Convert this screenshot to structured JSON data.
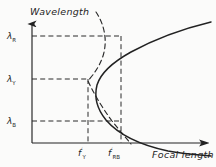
{
  "figure": {
    "kind": "hand-drawn-plot",
    "background_color": "#fbfbfa",
    "ink_color": "#222222",
    "axes": {
      "y_title": "Wavelength",
      "x_title": "Focal length",
      "origin_px": [
        32,
        143
      ],
      "y_top_px": 22,
      "x_right_px": 210
    },
    "y_ticks": [
      {
        "name": "lambda-R",
        "label_base": "λ",
        "label_sub": "R",
        "y_px": 36
      },
      {
        "name": "lambda-Y",
        "label_base": "λ",
        "label_sub": "Y",
        "y_px": 79
      },
      {
        "name": "lambda-B",
        "label_base": "λ",
        "label_sub": "B",
        "y_px": 121
      }
    ],
    "x_ticks": [
      {
        "name": "f-prime-Y",
        "label_base": "f",
        "label_prime": "′",
        "label_sub": "Y",
        "x_px": 82
      },
      {
        "name": "f-prime-RB",
        "label_base": "f",
        "label_prime": "′",
        "label_sub": "RB",
        "x_px": 120
      }
    ],
    "gridlines": [
      {
        "name": "gridline-lambda-R",
        "orientation": "horizontal",
        "from_px": [
          32,
          36
        ],
        "to_px": [
          121,
          36
        ]
      },
      {
        "name": "gridline-lambda-Y",
        "orientation": "horizontal",
        "from_px": [
          32,
          79
        ],
        "to_px": [
          90,
          79
        ]
      },
      {
        "name": "gridline-lambda-B",
        "orientation": "horizontal",
        "from_px": [
          32,
          121
        ],
        "to_px": [
          121,
          121
        ]
      },
      {
        "name": "gridline-f-prime-Y",
        "orientation": "vertical",
        "from_px": [
          88,
          79
        ],
        "to_px": [
          88,
          143
        ]
      },
      {
        "name": "gridline-f-prime-RB",
        "orientation": "vertical",
        "from_px": [
          121,
          36
        ],
        "to_px": [
          121,
          143
        ]
      }
    ],
    "curves": [
      {
        "name": "solid-dispersion-curve",
        "style": "solid",
        "description": "wide right-opening parabola, vertex at f'_Y / lambda_Y",
        "vertex_px": [
          88,
          79
        ],
        "points_px": [
          [
            210,
            22
          ],
          [
            196,
            26
          ],
          [
            178,
            31
          ],
          [
            160,
            37
          ],
          [
            143,
            44
          ],
          [
            130,
            52
          ],
          [
            120,
            61
          ],
          [
            110,
            72
          ],
          [
            103,
            85
          ],
          [
            100,
            95
          ],
          [
            100,
            106
          ],
          [
            104,
            118
          ],
          [
            112,
            130
          ],
          [
            124,
            140
          ],
          [
            134,
            145
          ],
          [
            150,
            149
          ],
          [
            170,
            152
          ],
          [
            190,
            154
          ],
          [
            210,
            155
          ]
        ]
      },
      {
        "name": "dashed-reference-curve",
        "style": "dashed",
        "description": "narrow right-opening parabola crossing the solid curve",
        "vertex_px": [
          86,
          80
        ],
        "points_px": [
          [
            96,
            12
          ],
          [
            102,
            20
          ],
          [
            106,
            30
          ],
          [
            106,
            42
          ],
          [
            102,
            54
          ],
          [
            96,
            66
          ],
          [
            90,
            76
          ],
          [
            88,
            82
          ],
          [
            90,
            92
          ],
          [
            96,
            104
          ],
          [
            105,
            116
          ],
          [
            115,
            127
          ],
          [
            124,
            136
          ],
          [
            130,
            143
          ]
        ]
      }
    ]
  }
}
